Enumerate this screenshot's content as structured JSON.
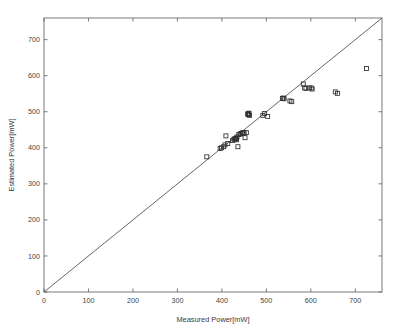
{
  "figure": {
    "background_color": "#ffffff",
    "axis_color": "#6b6b6b",
    "marker_color": "#2f2f2f",
    "line_color": "#4a4a4a"
  },
  "chart_data": {
    "type": "scatter",
    "title": "",
    "xlabel": "Measured Power[mW]",
    "ylabel": "Estimated Power[mW]",
    "xlim": [
      0,
      760
    ],
    "ylim": [
      0,
      760
    ],
    "xticks": [
      0,
      100,
      200,
      300,
      400,
      500,
      600,
      700
    ],
    "yticks": [
      0,
      100,
      200,
      300,
      400,
      500,
      600,
      700
    ],
    "xticklabels": [
      "0",
      "100",
      "200",
      "300",
      "400",
      "500",
      "600",
      "700"
    ],
    "yticklabels": [
      "0",
      "100",
      "200",
      "300",
      "400",
      "500",
      "600",
      "700"
    ],
    "grid": false,
    "legend": null,
    "marker_style": "open-square",
    "marker_size": 4,
    "reference_line": {
      "name": "identity-line",
      "description": "y = x",
      "slope": 1,
      "intercept": 0,
      "x_start": 0,
      "y_start": 0,
      "x_end": 760,
      "y_end": 760
    },
    "series": [
      {
        "name": "Measured vs Estimated Power",
        "points": [
          [
            366,
            375
          ],
          [
            396,
            398
          ],
          [
            399,
            400
          ],
          [
            404,
            403
          ],
          [
            407,
            408
          ],
          [
            409,
            433
          ],
          [
            413,
            412
          ],
          [
            424,
            420
          ],
          [
            427,
            424
          ],
          [
            429,
            424
          ],
          [
            430,
            425
          ],
          [
            431,
            426
          ],
          [
            432,
            427
          ],
          [
            433,
            422
          ],
          [
            434,
            430
          ],
          [
            436,
            403
          ],
          [
            438,
            437
          ],
          [
            441,
            438
          ],
          [
            443,
            440
          ],
          [
            446,
            441
          ],
          [
            448,
            442
          ],
          [
            450,
            441
          ],
          [
            452,
            428
          ],
          [
            455,
            442
          ],
          [
            458,
            493
          ],
          [
            459,
            495
          ],
          [
            460,
            492
          ],
          [
            461,
            496
          ],
          [
            462,
            490
          ],
          [
            492,
            490
          ],
          [
            496,
            495
          ],
          [
            503,
            487
          ],
          [
            536,
            537
          ],
          [
            538,
            538
          ],
          [
            540,
            536
          ],
          [
            553,
            530
          ],
          [
            557,
            528
          ],
          [
            583,
            577
          ],
          [
            586,
            566
          ],
          [
            589,
            565
          ],
          [
            597,
            566
          ],
          [
            601,
            566
          ],
          [
            603,
            563
          ],
          [
            655,
            555
          ],
          [
            660,
            551
          ],
          [
            725,
            620
          ]
        ]
      }
    ]
  }
}
